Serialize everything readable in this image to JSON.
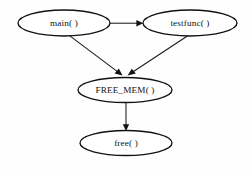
{
  "diagram": {
    "type": "call-graph",
    "background_color": "#fefefe",
    "stroke_color": "#111111",
    "nodes": [
      {
        "id": "main",
        "label": "main( )",
        "shape": "ellipse",
        "cx": 64,
        "cy": 23,
        "rx": 46,
        "ry": 13
      },
      {
        "id": "testfunc",
        "label": "testfunc( )",
        "shape": "ellipse",
        "cx": 190,
        "cy": 23,
        "rx": 47,
        "ry": 13
      },
      {
        "id": "free_mem",
        "label": "FREE_MEM( )",
        "shape": "ellipse",
        "cx": 125,
        "cy": 90,
        "rx": 47,
        "ry": 12.5
      },
      {
        "id": "free",
        "label": "free( )",
        "shape": "ellipse",
        "cx": 126,
        "cy": 143,
        "rx": 46,
        "ry": 12.5
      }
    ],
    "edges": [
      {
        "id": "main-to-testfunc",
        "from": "main",
        "to": "testfunc",
        "directed": true
      },
      {
        "id": "main-to-free-mem",
        "from": "main",
        "to": "free_mem",
        "directed": true
      },
      {
        "id": "testfunc-to-free-mem",
        "from": "testfunc",
        "to": "free_mem",
        "directed": true
      },
      {
        "id": "free-mem-to-free",
        "from": "free_mem",
        "to": "free",
        "directed": true
      }
    ]
  }
}
